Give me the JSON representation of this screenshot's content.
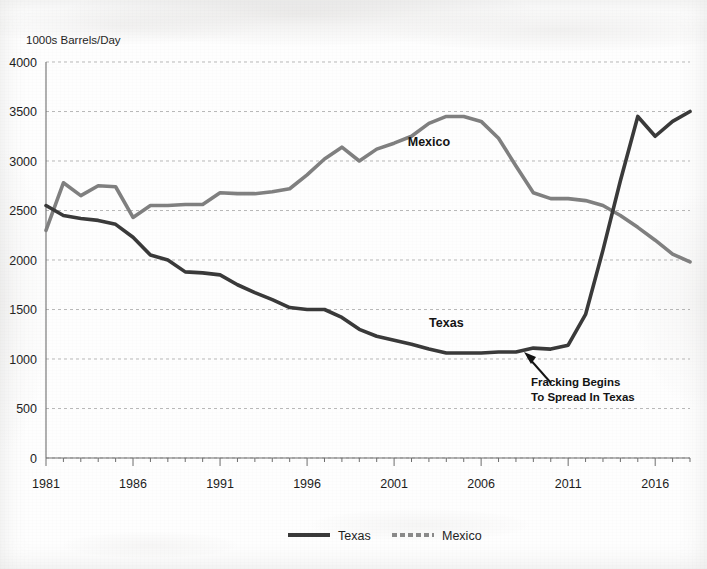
{
  "chart_data": {
    "type": "line",
    "title": "",
    "subtitle": "",
    "ylabel": "1000s Barrels/Day",
    "xlabel": "",
    "ylim": [
      0,
      4000
    ],
    "xlim": [
      1981,
      2018
    ],
    "ytick_step": 500,
    "ytick_labels": [
      "4000",
      "3500",
      "3000",
      "2500",
      "2000",
      "1500",
      "1000",
      "500",
      "0"
    ],
    "ytick_values": [
      4000,
      3500,
      3000,
      2500,
      2000,
      1500,
      1000,
      500,
      0
    ],
    "xtick_labels": [
      "1981",
      "1986",
      "1991",
      "1996",
      "2001",
      "2006",
      "2011",
      "2016"
    ],
    "xtick_values": [
      1981,
      1986,
      1991,
      1996,
      2001,
      2006,
      2011,
      2016
    ],
    "grid": "horizontal-dotted",
    "legend_position": "bottom-center",
    "x": [
      1981,
      1982,
      1983,
      1984,
      1985,
      1986,
      1987,
      1988,
      1989,
      1990,
      1991,
      1992,
      1993,
      1994,
      1995,
      1996,
      1997,
      1998,
      1999,
      2000,
      2001,
      2002,
      2003,
      2004,
      2005,
      2006,
      2007,
      2008,
      2009,
      2010,
      2011,
      2012,
      2013,
      2014,
      2015,
      2016,
      2017,
      2018
    ],
    "series": [
      {
        "name": "Texas",
        "color": "#3a3a3a",
        "style": "solid",
        "values": [
          2550,
          2450,
          2420,
          2400,
          2360,
          2230,
          2050,
          2000,
          1880,
          1870,
          1850,
          1750,
          1670,
          1600,
          1520,
          1500,
          1500,
          1420,
          1300,
          1230,
          1190,
          1150,
          1100,
          1060,
          1060,
          1060,
          1070,
          1070,
          1110,
          1100,
          1140,
          1450,
          2100,
          2800,
          3450,
          3250,
          3400,
          3500
        ]
      },
      {
        "name": "Mexico",
        "color": "#808080",
        "style": "solid-light",
        "values": [
          2300,
          2780,
          2650,
          2750,
          2740,
          2430,
          2550,
          2550,
          2560,
          2560,
          2680,
          2670,
          2670,
          2690,
          2720,
          2860,
          3020,
          3140,
          3000,
          3120,
          3180,
          3250,
          3380,
          3450,
          3450,
          3400,
          3230,
          2950,
          2680,
          2620,
          2620,
          2600,
          2550,
          2450,
          2330,
          2200,
          2060,
          1980
        ]
      }
    ],
    "annotations": [
      {
        "id": "inline-label-mexico",
        "text": "Mexico",
        "x": 2003,
        "y": 3150
      },
      {
        "id": "inline-label-texas",
        "text": "Texas",
        "x": 2004,
        "y": 1320
      },
      {
        "id": "fracking-callout",
        "line1": "Fracking Begins",
        "line2": "To Spread In Texas",
        "target_x": 2011,
        "target_y": 1140
      }
    ],
    "legend": [
      {
        "label": "Texas",
        "color": "#3a3a3a",
        "style": "solid"
      },
      {
        "label": "Mexico",
        "color": "#8a8a8a",
        "style": "dashed"
      }
    ]
  }
}
